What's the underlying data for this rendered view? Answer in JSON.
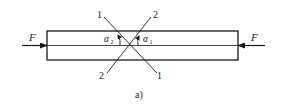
{
  "figure": {
    "caption": "a)",
    "colors": {
      "stroke": "#1a1a1a",
      "background": "#ffffff"
    },
    "force_left": {
      "label": "F",
      "direction": "right"
    },
    "force_right": {
      "label": "F",
      "direction": "left"
    },
    "section_1": {
      "top_label": "1",
      "bottom_label": "1"
    },
    "section_2": {
      "top_label": "2",
      "bottom_label": "2"
    },
    "angle_1": {
      "symbol": "α",
      "subscript": "1"
    },
    "angle_2": {
      "symbol": "α",
      "subscript": "2"
    }
  }
}
